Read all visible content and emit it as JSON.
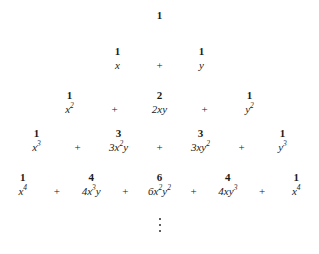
{
  "figure": {
    "background_color": "#ffffff",
    "text_color": "#1a1a1a",
    "operator": "+",
    "ellipsis_symbol": "vertical-ellipsis",
    "rows": [
      {
        "power": 0,
        "top": 8,
        "cell_width": 62,
        "op_width": 0,
        "coefficients": [
          "1"
        ],
        "terms": [
          ""
        ]
      },
      {
        "power": 1,
        "top": 44,
        "cell_width": 42,
        "op_width": 42,
        "coefficients": [
          "1",
          "1"
        ],
        "terms": [
          "x",
          "y"
        ]
      },
      {
        "power": 2,
        "top": 88,
        "cell_width": 48,
        "op_width": 42,
        "coefficients": [
          "1",
          "2",
          "1"
        ],
        "terms": [
          "x2",
          "2xy",
          "y2"
        ]
      },
      {
        "power": 3,
        "top": 126,
        "cell_width": 48,
        "op_width": 34,
        "coefficients": [
          "1",
          "3",
          "3",
          "1"
        ],
        "terms": [
          "x3",
          "3x2y",
          "3xy2",
          "y3"
        ]
      },
      {
        "power": 4,
        "top": 170,
        "cell_width": 48,
        "op_width": 24,
        "coefficients": [
          "1",
          "4",
          "6",
          "4",
          "1"
        ],
        "terms": [
          "x4",
          "4x3y",
          "6x2y2",
          "4xy3",
          "x4"
        ]
      }
    ],
    "ellipsis": {
      "top": 218,
      "dot_count": 3
    }
  }
}
